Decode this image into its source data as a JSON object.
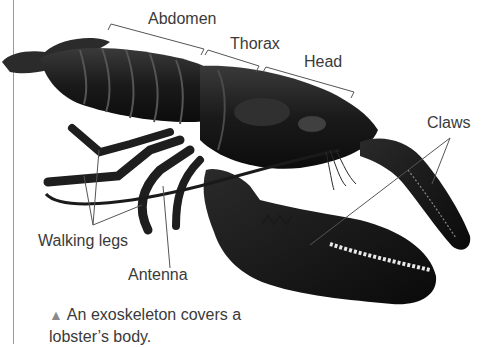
{
  "figure": {
    "labels": {
      "abdomen": "Abdomen",
      "thorax": "Thorax",
      "head": "Head",
      "claws": "Claws",
      "walking_legs": "Walking legs",
      "antenna": "Antenna"
    }
  },
  "caption": {
    "marker": "▲",
    "text": "An exoskeleton covers a lobster’s body."
  },
  "colors": {
    "leader_lines": "#555555",
    "caption_marker": "#8a8a8a",
    "text": "#3a3a3a"
  }
}
